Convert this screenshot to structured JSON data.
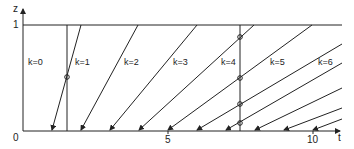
{
  "diagram": {
    "axes": {
      "y_label": "z",
      "x_label": "t",
      "origin_label": "0",
      "y_tick_label": "1",
      "x_tick_labels": [
        "5",
        "10"
      ]
    },
    "regions": [
      {
        "label": "k=0"
      },
      {
        "label": "k=1"
      },
      {
        "label": "k=2"
      },
      {
        "label": "k=3"
      },
      {
        "label": "k=4"
      },
      {
        "label": "k=5"
      },
      {
        "label": "k=6"
      }
    ],
    "line_color": "#222222",
    "background": "#ffffff"
  }
}
